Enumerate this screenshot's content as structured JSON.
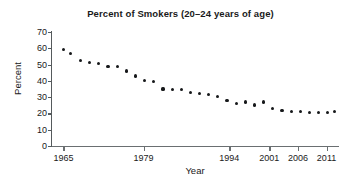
{
  "chart_data": {
    "type": "scatter",
    "title": "Percent of Smokers (20–24 years of age)",
    "xlabel": "Year",
    "ylabel": "Percent",
    "grid": false,
    "legend": null,
    "xlim": [
      1963,
      2013
    ],
    "ylim": [
      0,
      70
    ],
    "xticks": [
      1965,
      1979,
      1994,
      2001,
      2006,
      2011
    ],
    "xtick_labels": [
      "1965",
      "1979",
      "1994",
      "2001",
      "2006",
      "2011"
    ],
    "yticks": [
      0,
      10,
      20,
      30,
      40,
      50,
      60,
      70
    ],
    "ytick_labels": [
      "0",
      "10",
      "20",
      "30",
      "40",
      "50",
      "60",
      "70"
    ],
    "marker": "filled-circle",
    "marker_color": "#16181a",
    "x": [
      1965,
      1966,
      1968,
      1970,
      1974,
      1976,
      1977,
      1978,
      1979,
      1980,
      1983,
      1985,
      1987,
      1988,
      1990,
      1991,
      1992,
      1993,
      1994,
      1995,
      1997,
      1998,
      1999,
      2000,
      2001,
      2002,
      2003,
      2004,
      2005,
      2006,
      2007,
      2008,
      2009,
      2010,
      2011,
      2012
    ],
    "y": [
      59.5,
      56.8,
      52.5,
      51.5,
      50.8,
      49.0,
      49.0,
      46.0,
      43.0,
      40.0,
      39.8,
      35.0,
      34.8,
      34.8,
      33.0,
      32.3,
      31.5,
      30.3,
      28.0,
      26.0,
      27.0,
      25.2,
      27.0,
      23.0,
      22.0,
      21.3,
      35.0,
      34.8,
      34.8,
      33.0,
      32.3,
      31.5,
      30.3,
      28.0,
      26.0,
      21.3
    ],
    "points": [
      {
        "year": 1965,
        "percent": 59.5
      },
      {
        "year": 1966,
        "percent": 56.8
      },
      {
        "year": 1968,
        "percent": 52.5
      },
      {
        "year": 1970,
        "percent": 51.5
      },
      {
        "year": 1972,
        "percent": 50.8
      },
      {
        "year": 1974,
        "percent": 49.0
      },
      {
        "year": 1976,
        "percent": 49.0
      },
      {
        "year": 1978,
        "percent": 46.0
      },
      {
        "year": 1980,
        "percent": 43.0
      },
      {
        "year": 1982,
        "percent": 40.0
      },
      {
        "year": 1984,
        "percent": 39.8
      },
      {
        "year": 1986,
        "percent": 35.0
      },
      {
        "year": 1988,
        "percent": 34.8
      },
      {
        "year": 1990,
        "percent": 34.8
      },
      {
        "year": 1992,
        "percent": 33.0
      },
      {
        "year": 1994,
        "percent": 32.3
      },
      {
        "year": 1995,
        "percent": 31.5
      },
      {
        "year": 1997,
        "percent": 30.3
      },
      {
        "year": 1999,
        "percent": 28.0
      },
      {
        "year": 2000,
        "percent": 26.0
      },
      {
        "year": 2001,
        "percent": 27.0
      },
      {
        "year": 2002,
        "percent": 25.2
      },
      {
        "year": 2003,
        "percent": 27.0
      },
      {
        "year": 2004,
        "percent": 23.0
      },
      {
        "year": 2005,
        "percent": 22.0
      },
      {
        "year": 2006,
        "percent": 21.3
      }
    ],
    "series": [
      {
        "name": "Percent of Smokers",
        "x": [
          1965,
          1966.2,
          1968,
          1969.6,
          1971.2,
          1972.8,
          1974.4,
          1976,
          1977.6,
          1979.2,
          1980.8,
          1982.4,
          1984,
          1985.6,
          1987.2,
          1988.8,
          1990.4,
          1992,
          1993.6,
          1995.2,
          1996.8,
          1998.4,
          2000,
          2001.6,
          2003.2,
          2004.8,
          2006.4,
          2008,
          2009.6,
          2011.2,
          2012.4
        ],
        "values": [
          59.5,
          56.8,
          52.5,
          51.5,
          50.8,
          49.0,
          49.0,
          46.0,
          43.0,
          40.0,
          39.8,
          35.0,
          34.8,
          34.8,
          33.0,
          32.3,
          31.5,
          30.3,
          28.0,
          26.0,
          27.0,
          25.2,
          27.0,
          23.0,
          22.0,
          21.3,
          21.0,
          20.8,
          20.5,
          20.4,
          21.0
        ]
      }
    ]
  },
  "title": "Percent of Smokers (20–24 years of age)",
  "axes": {
    "x": {
      "label": "Year"
    },
    "y": {
      "label": "Percent"
    }
  }
}
